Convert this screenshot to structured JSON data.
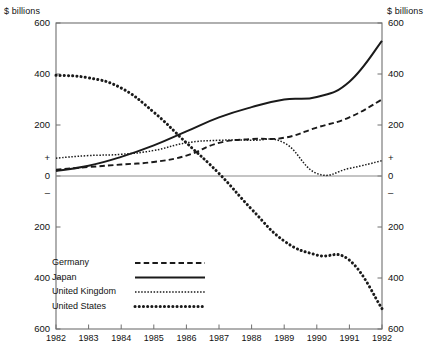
{
  "figure": {
    "cropped_title": "",
    "unit_label_left": "$ billions",
    "unit_label_right": "$ billions"
  },
  "axes": {
    "y_left_ticks": [
      "600",
      "400",
      "200",
      "+",
      "0",
      "–",
      "200",
      "400",
      "600"
    ],
    "y_right_ticks": [
      "600",
      "400",
      "200",
      "+",
      "0",
      "–",
      "200",
      "400",
      "600"
    ],
    "x_ticks": [
      "1982",
      "1983",
      "1984",
      "1985",
      "1986",
      "1987",
      "1988",
      "1989",
      "1990",
      "1991",
      "1992"
    ]
  },
  "legend": {
    "items": [
      {
        "label": "Germany",
        "style": "dashed"
      },
      {
        "label": "Japan",
        "style": "solid"
      },
      {
        "label": "United Kingdom",
        "style": "fine-dotted"
      },
      {
        "label": "United States",
        "style": "thick-dotted"
      }
    ]
  },
  "colors": {
    "ink": "#1a1a1a",
    "frame": "#6f6f6f",
    "zero_line": "#8a8a8a",
    "background": "#ffffff"
  },
  "chart_data": {
    "type": "line",
    "title": "",
    "subtitle": "",
    "xlabel": "",
    "ylabel": "$ billions",
    "ylabel_right": "$ billions",
    "ylim": [
      -600,
      600
    ],
    "xlim": [
      1982,
      1992
    ],
    "grid": false,
    "legend_position": "lower-left inside plot",
    "y_tick_values": [
      600,
      400,
      200,
      0,
      -200,
      -400,
      -600
    ],
    "zero_line": true,
    "x": [
      1982,
      1983,
      1984,
      1985,
      1986,
      1987,
      1988,
      1989,
      1990,
      1991,
      1992
    ],
    "series": [
      {
        "name": "Germany",
        "style": "dashed",
        "values": [
          25,
          35,
          45,
          55,
          80,
          130,
          145,
          150,
          190,
          230,
          300
        ]
      },
      {
        "name": "Japan",
        "style": "solid",
        "values": [
          20,
          40,
          75,
          120,
          175,
          230,
          270,
          300,
          310,
          370,
          530
        ]
      },
      {
        "name": "United Kingdom",
        "style": "fine-dotted",
        "values": [
          70,
          80,
          85,
          100,
          130,
          140,
          140,
          130,
          10,
          30,
          60
        ]
      },
      {
        "name": "United States",
        "style": "thick-dotted",
        "values": [
          395,
          385,
          345,
          250,
          130,
          10,
          -130,
          -255,
          -310,
          -330,
          -520
        ]
      }
    ]
  }
}
